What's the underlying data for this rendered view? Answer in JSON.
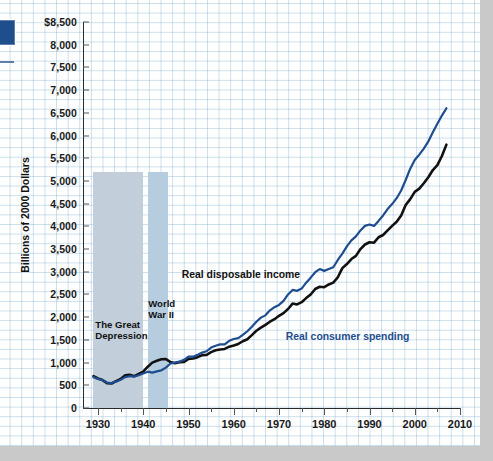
{
  "markers": {
    "swatch_color": "#1f4e8c",
    "rule_color": "#5b7fa8"
  },
  "chart_data": {
    "type": "line",
    "title": "",
    "xlabel": "",
    "ylabel": "Billions of 2000 Dollars",
    "ylim": [
      0,
      8500
    ],
    "xlim": [
      1929,
      2010
    ],
    "grid": true,
    "legend_position": "inline-annotation",
    "y_ticks": [
      0,
      500,
      1000,
      1500,
      2000,
      2500,
      3000,
      3500,
      4000,
      4500,
      5000,
      5500,
      6000,
      6500,
      7000,
      7500,
      8000,
      8500
    ],
    "y_tick_labels": [
      "0",
      "500",
      "1,000",
      "1,500",
      "2,000",
      "2,500",
      "3,000",
      "3,500",
      "4,000",
      "4,500",
      "5,000",
      "5,500",
      "6,000",
      "6,500",
      "7,000",
      "7,500",
      "8,000",
      "$8,500"
    ],
    "x_ticks": [
      1930,
      1940,
      1950,
      1960,
      1970,
      1980,
      1990,
      2000,
      2010
    ],
    "x_tick_labels": [
      "1930",
      "1940",
      "1950",
      "1960",
      "1970",
      "1980",
      "1990",
      "2000",
      "2010"
    ],
    "x_minor_ticks": [
      1935,
      1945,
      1955,
      1965,
      1975,
      1985,
      1995,
      2005
    ],
    "annotations": [
      {
        "name": "great-depression-band",
        "text": "The Great\nDepression",
        "x_start": 1929,
        "x_end": 1940,
        "color": "#c2cfdb",
        "top_value": 5200
      },
      {
        "name": "world-war-two-band",
        "text": "World\nWar II",
        "x_start": 1941,
        "x_end": 1945.5,
        "color": "#b6cde0",
        "top_value": 5200
      }
    ],
    "series": [
      {
        "name": "Real disposable income",
        "color": "#111111",
        "label_text": "Real disposable income",
        "x": [
          1929,
          1930,
          1931,
          1932,
          1933,
          1934,
          1935,
          1936,
          1937,
          1938,
          1939,
          1940,
          1941,
          1942,
          1943,
          1944,
          1945,
          1946,
          1947,
          1948,
          1949,
          1950,
          1951,
          1952,
          1953,
          1954,
          1955,
          1956,
          1957,
          1958,
          1959,
          1960,
          1961,
          1962,
          1963,
          1964,
          1965,
          1966,
          1967,
          1968,
          1969,
          1970,
          1971,
          1972,
          1973,
          1974,
          1975,
          1976,
          1977,
          1978,
          1979,
          1980,
          1981,
          1982,
          1983,
          1984,
          1985,
          1986,
          1987,
          1988,
          1989,
          1990,
          1991,
          1992,
          1993,
          1994,
          1995,
          1996,
          1997,
          1998,
          1999,
          2000,
          2001,
          2002,
          2003,
          2004,
          2005,
          2006,
          2007
        ],
        "values": [
          700,
          650,
          615,
          545,
          540,
          590,
          640,
          720,
          730,
          700,
          750,
          800,
          910,
          1000,
          1040,
          1075,
          1080,
          1010,
          985,
          1010,
          1015,
          1080,
          1090,
          1120,
          1160,
          1170,
          1230,
          1270,
          1290,
          1300,
          1350,
          1375,
          1410,
          1470,
          1515,
          1605,
          1700,
          1770,
          1830,
          1900,
          1955,
          2030,
          2090,
          2180,
          2300,
          2280,
          2330,
          2420,
          2500,
          2620,
          2670,
          2660,
          2720,
          2760,
          2880,
          3080,
          3170,
          3280,
          3350,
          3500,
          3600,
          3650,
          3640,
          3760,
          3810,
          3910,
          4010,
          4100,
          4240,
          4470,
          4600,
          4760,
          4830,
          4950,
          5080,
          5240,
          5350,
          5550,
          5800
        ]
      },
      {
        "name": "Real consumer spending",
        "color": "#1e4d8f",
        "label_text": "Real consumer spending",
        "x": [
          1929,
          1930,
          1931,
          1932,
          1933,
          1934,
          1935,
          1936,
          1937,
          1938,
          1939,
          1940,
          1941,
          1942,
          1943,
          1944,
          1945,
          1946,
          1947,
          1948,
          1949,
          1950,
          1951,
          1952,
          1953,
          1954,
          1955,
          1956,
          1957,
          1958,
          1959,
          1960,
          1961,
          1962,
          1963,
          1964,
          1965,
          1966,
          1967,
          1968,
          1969,
          1970,
          1971,
          1972,
          1973,
          1974,
          1975,
          1976,
          1977,
          1978,
          1979,
          1980,
          1981,
          1982,
          1983,
          1984,
          1985,
          1986,
          1987,
          1988,
          1989,
          1990,
          1991,
          1992,
          1993,
          1994,
          1995,
          1996,
          1997,
          1998,
          1999,
          2000,
          2001,
          2002,
          2003,
          2004,
          2005,
          2006,
          2007
        ],
        "values": [
          680,
          640,
          615,
          560,
          550,
          580,
          620,
          680,
          700,
          690,
          720,
          760,
          800,
          780,
          805,
          830,
          890,
          980,
          1000,
          1020,
          1060,
          1130,
          1130,
          1170,
          1220,
          1250,
          1330,
          1370,
          1400,
          1400,
          1480,
          1520,
          1540,
          1610,
          1690,
          1790,
          1900,
          1990,
          2040,
          2150,
          2220,
          2270,
          2360,
          2500,
          2600,
          2580,
          2630,
          2760,
          2870,
          2990,
          3060,
          3020,
          3060,
          3100,
          3260,
          3400,
          3560,
          3690,
          3780,
          3910,
          4010,
          4040,
          4010,
          4120,
          4240,
          4380,
          4490,
          4620,
          4790,
          5020,
          5270,
          5460,
          5580,
          5710,
          5870,
          6070,
          6260,
          6440,
          6600
        ]
      }
    ]
  }
}
